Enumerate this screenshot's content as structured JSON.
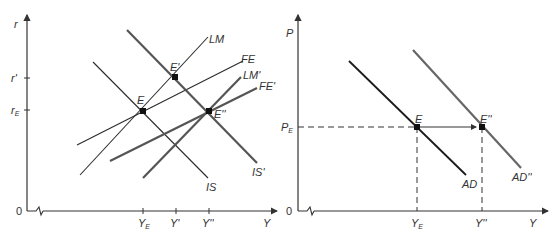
{
  "colors": {
    "thin_line": "#2b2b2b",
    "thick_line": "#555555",
    "axis": "#333333",
    "text": "#333333"
  },
  "left_panel": {
    "y_axis_label": "r",
    "x_axis_label": "Y",
    "origin_label": "0",
    "y_ticks": [
      {
        "label": "r'",
        "sub": ""
      },
      {
        "label": "r",
        "sub": "E"
      }
    ],
    "x_ticks": [
      {
        "label": "Y",
        "sub": "E"
      },
      {
        "label": "Y'",
        "sub": ""
      },
      {
        "label": "Y''",
        "sub": ""
      }
    ],
    "curves": {
      "LM": "LM",
      "FE": "FE",
      "LM_prime": "LM'",
      "FE_prime": "FE'",
      "IS": "IS",
      "IS_prime": "IS'"
    },
    "points": {
      "E": "E",
      "E_prime": "E'",
      "E_double_prime": "E''"
    }
  },
  "right_panel": {
    "y_axis_label": "P",
    "x_axis_label": "Y",
    "origin_label": "0",
    "y_ticks": [
      {
        "label": "P",
        "sub": "E"
      }
    ],
    "x_ticks": [
      {
        "label": "Y",
        "sub": "E"
      },
      {
        "label": "Y''",
        "sub": ""
      }
    ],
    "curves": {
      "AD": "AD",
      "AD_double_prime": "AD''"
    },
    "points": {
      "E": "E",
      "E_double_prime": "E''"
    }
  }
}
